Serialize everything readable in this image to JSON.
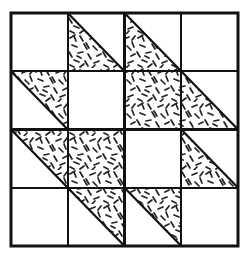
{
  "figure": {
    "background_color": "#ffffff",
    "line_color": "#111111",
    "fabric_print_color": "#222222",
    "fabric_background_color": "#ffffff"
  },
  "geometry": {
    "block_left": 11,
    "block_top": 13,
    "block_right": 238,
    "block_bottom": 246,
    "columns": 4,
    "rows": 4,
    "cell_width": 56.75,
    "cell_height": 58.25,
    "outer_border_width": 3,
    "inner_grid_width": 2.2,
    "diagonal_width": 2.2,
    "x_gridlines": [
      11,
      67.75,
      124.5,
      181.25,
      238
    ],
    "y_gridlines": [
      13,
      71.25,
      129.5,
      187.75,
      246
    ]
  },
  "legend": {
    "plain_label": "plain",
    "print_label": "print",
    "triangle_bottom_left_label": "half-square triangle, print on lower-left",
    "triangle_top_right_label": "half-square triangle, print on upper-right",
    "full_print_label": "full print square"
  },
  "patches": [
    {
      "row": 0,
      "col": 0,
      "name": "patch-r0c0",
      "kind": "plain",
      "fill": "plain"
    },
    {
      "row": 0,
      "col": 1,
      "name": "patch-r0c1",
      "kind": "triangle-bl",
      "fill": "print"
    },
    {
      "row": 0,
      "col": 2,
      "name": "patch-r0c2",
      "kind": "triangle-bl",
      "fill": "print"
    },
    {
      "row": 0,
      "col": 3,
      "name": "patch-r0c3",
      "kind": "plain",
      "fill": "plain"
    },
    {
      "row": 1,
      "col": 0,
      "name": "patch-r1c0",
      "kind": "triangle-tr",
      "fill": "print"
    },
    {
      "row": 1,
      "col": 1,
      "name": "patch-r1c1",
      "kind": "plain",
      "fill": "plain"
    },
    {
      "row": 1,
      "col": 2,
      "name": "patch-r1c2",
      "kind": "full",
      "fill": "print"
    },
    {
      "row": 1,
      "col": 3,
      "name": "patch-r1c3",
      "kind": "triangle-bl",
      "fill": "print"
    },
    {
      "row": 2,
      "col": 0,
      "name": "patch-r2c0",
      "kind": "triangle-tr",
      "fill": "print"
    },
    {
      "row": 2,
      "col": 1,
      "name": "patch-r2c1",
      "kind": "full",
      "fill": "print"
    },
    {
      "row": 2,
      "col": 2,
      "name": "patch-r2c2",
      "kind": "plain",
      "fill": "plain"
    },
    {
      "row": 2,
      "col": 3,
      "name": "patch-r2c3",
      "kind": "triangle-bl",
      "fill": "print"
    },
    {
      "row": 3,
      "col": 0,
      "name": "patch-r3c0",
      "kind": "plain",
      "fill": "plain"
    },
    {
      "row": 3,
      "col": 1,
      "name": "patch-r3c1",
      "kind": "triangle-tr",
      "fill": "print"
    },
    {
      "row": 3,
      "col": 2,
      "name": "patch-r3c2",
      "kind": "triangle-tr",
      "fill": "print"
    },
    {
      "row": 3,
      "col": 3,
      "name": "patch-r3c3",
      "kind": "plain",
      "fill": "plain"
    }
  ]
}
